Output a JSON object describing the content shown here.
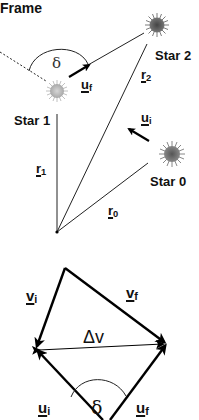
{
  "figure": {
    "title": "Frame",
    "top_panel": {
      "stars": [
        {
          "name": "Star 0",
          "label": "Star 0",
          "color": "#6e6e6e"
        },
        {
          "name": "Star 1",
          "label": "Star 1",
          "color": "#b5b5b5"
        },
        {
          "name": "Star 2",
          "label": "Star 2",
          "color": "#5a5a5a"
        }
      ],
      "position_vectors": [
        {
          "base": "r",
          "sub": "0"
        },
        {
          "base": "r",
          "sub": "1"
        },
        {
          "base": "r",
          "sub": "2"
        }
      ],
      "velocity_vectors": [
        {
          "base": "u",
          "sub": "i"
        },
        {
          "base": "u",
          "sub": "f"
        }
      ],
      "angle_label": "δ"
    },
    "bottom_panel": {
      "vectors": [
        {
          "base": "v",
          "sub": "i"
        },
        {
          "base": "v",
          "sub": "f"
        },
        {
          "base": "u",
          "sub": "i"
        },
        {
          "base": "u",
          "sub": "f"
        }
      ],
      "delta_v_label": "Δv",
      "angle_label": "δ"
    }
  }
}
